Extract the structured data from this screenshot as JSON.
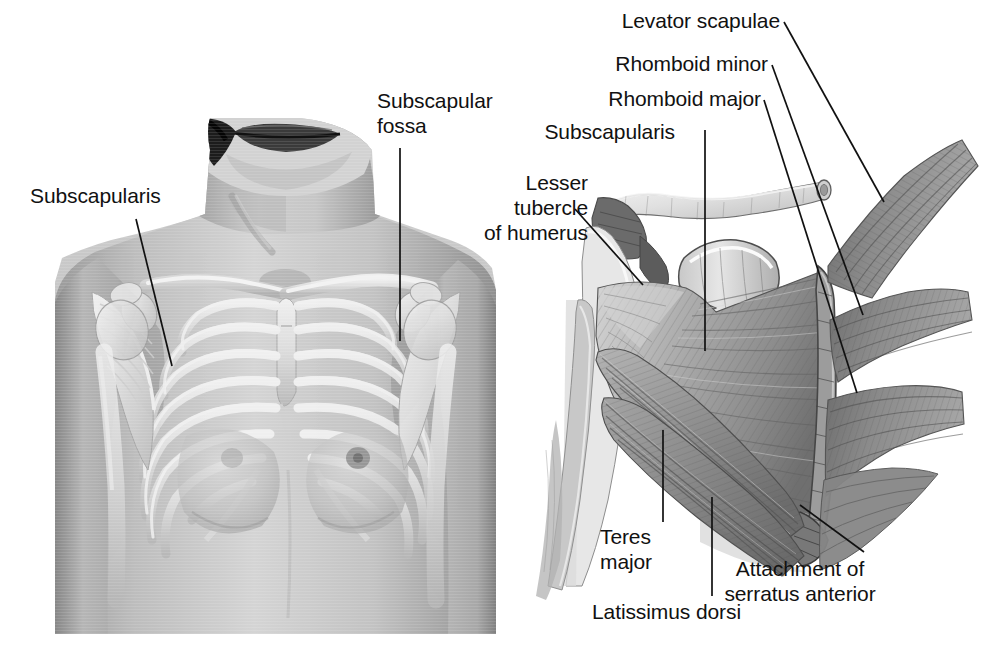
{
  "figure": {
    "background_color": "#ffffff",
    "ink_color": "#111111",
    "width": 990,
    "height": 658
  },
  "panels": [
    {
      "id": "anterior-thorax-photo",
      "name": "anterior thorax photograph with superimposed skeleton",
      "description": "Anterior view of a female torso, head cropped at mouth, with the clavicles, ribcage, sternum, scapulae and humeri shown through the skin"
    },
    {
      "id": "scapula-costal-surface",
      "name": "costal surface of scapula with muscles",
      "description": "Anterolateral view of the right scapula and clavicle showing subscapularis filling the subscapular fossa, serratus anterior digitations on the medial border, teres major and latissimus dorsi below"
    }
  ],
  "labels": [
    {
      "id": "subscapularis-left",
      "text": "Subscapularis",
      "lines": [
        "Subscapularis"
      ],
      "align": "left",
      "x": 30,
      "y": 183,
      "leader": {
        "x1": 136,
        "y1": 219,
        "x2": 172,
        "y2": 366
      }
    },
    {
      "id": "subscapular-fossa",
      "text": "Subscapular fossa",
      "lines": [
        "Subscapular",
        "fossa"
      ],
      "align": "left",
      "x": 377,
      "y": 88,
      "leader": {
        "x1": 400,
        "y1": 148,
        "x2": 400,
        "y2": 341
      }
    },
    {
      "id": "lesser-tubercle-of-humerus",
      "text": "Lesser tubercle of humerus",
      "lines": [
        "Lesser",
        "tubercle",
        "of humerus"
      ],
      "align": "right",
      "x": 468,
      "y": 170,
      "leader": {
        "x1": 575,
        "y1": 209,
        "x2": 643,
        "y2": 285
      }
    },
    {
      "id": "levator-scapulae",
      "text": "Levator scapulae",
      "lines": [
        "Levator scapulae"
      ],
      "align": "right",
      "x": 603,
      "y": 8,
      "leader": {
        "x1": 784,
        "y1": 22,
        "x2": 884,
        "y2": 202
      }
    },
    {
      "id": "rhomboid-minor",
      "text": "Rhomboid minor",
      "lines": [
        "Rhomboid minor"
      ],
      "align": "right",
      "x": 595,
      "y": 51,
      "leader": {
        "x1": 772,
        "y1": 65,
        "x2": 863,
        "y2": 315
      }
    },
    {
      "id": "rhomboid-major",
      "text": "Rhomboid major",
      "lines": [
        "Rhomboid major"
      ],
      "align": "right",
      "x": 589,
      "y": 86,
      "leader": {
        "x1": 764,
        "y1": 100,
        "x2": 857,
        "y2": 393
      }
    },
    {
      "id": "subscapularis-right",
      "text": "Subscapularis",
      "lines": [
        "Subscapularis"
      ],
      "align": "right",
      "x": 530,
      "y": 119,
      "leader": {
        "x1": 705,
        "y1": 130,
        "x2": 705,
        "y2": 351
      }
    },
    {
      "id": "teres-major",
      "text": "Teres major",
      "lines": [
        "Teres",
        "major"
      ],
      "align": "left",
      "x": 600,
      "y": 524,
      "leader": {
        "x1": 663,
        "y1": 522,
        "x2": 663,
        "y2": 430
      }
    },
    {
      "id": "latissimus-dorsi",
      "text": "Latissimus dorsi",
      "lines": [
        "Latissimus dorsi"
      ],
      "align": "left",
      "x": 592,
      "y": 599,
      "leader": {
        "x1": 712,
        "y1": 596,
        "x2": 712,
        "y2": 497
      }
    },
    {
      "id": "attachment-of-serratus-anterior",
      "text": "Attachment of serratus anterior",
      "lines": [
        "Attachment of",
        "serratus anterior"
      ],
      "align": "center",
      "x": 800,
      "y": 556,
      "leader": {
        "x1": 864,
        "y1": 552,
        "x2": 800,
        "y2": 505
      }
    }
  ]
}
